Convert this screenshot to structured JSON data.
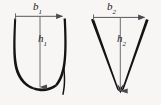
{
  "figure": {
    "background_color": "#f7f6f4",
    "stroke_color": "#1b1b1b",
    "arrow_color": "#55555a",
    "shapes": [
      {
        "id": "u-shape",
        "name": "parabolic-u-cross-section",
        "outline_style": "thick-tapered-stroke",
        "base_label": "b",
        "base_subscript": "1",
        "height_label": "h",
        "height_subscript": "1",
        "base_label_full": "b1",
        "height_label_full": "h1",
        "base_arrow": {
          "x1": 15,
          "y1": 16,
          "x2": 63,
          "y2": 16,
          "direction": "right"
        },
        "height_arrow": {
          "x1": 40,
          "y1": 16,
          "x2": 40,
          "y2": 88,
          "direction": "down"
        }
      },
      {
        "id": "v-shape",
        "name": "triangular-v-cross-section",
        "outline_style": "thick-tapered-stroke",
        "base_label": "b",
        "base_subscript": "2",
        "height_label": "h",
        "height_subscript": "2",
        "base_label_full": "b2",
        "height_label_full": "h2",
        "base_arrow": {
          "x1": 93,
          "y1": 17,
          "x2": 145,
          "y2": 17,
          "direction": "right"
        },
        "height_arrow": {
          "x1": 120,
          "y1": 17,
          "x2": 120,
          "y2": 92,
          "direction": "down"
        }
      }
    ],
    "labels": {
      "b1": {
        "text": "b",
        "sub": "1"
      },
      "h1": {
        "text": "h",
        "sub": "1"
      },
      "b2": {
        "text": "b",
        "sub": "2"
      },
      "h2": {
        "text": "h",
        "sub": "2"
      }
    }
  }
}
